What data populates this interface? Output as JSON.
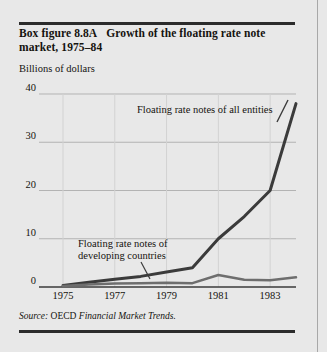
{
  "figure": {
    "label": "Box figure 8.8A",
    "title": "Growth of the floating rate note market, 1975–84",
    "source_prefix": "Source:",
    "source_org": "OECD",
    "source_publication": "Financial Market Trends."
  },
  "chart_data": {
    "type": "line",
    "title": "Growth of the floating rate note market, 1975–84",
    "xlabel": "",
    "ylabel": "Billions of dollars",
    "x": [
      1975,
      1976,
      1977,
      1978,
      1979,
      1980,
      1981,
      1982,
      1983,
      1984
    ],
    "xtick_labels": [
      "1975",
      "1977",
      "1979",
      "1981",
      "1983"
    ],
    "xticks": [
      1975,
      1977,
      1979,
      1981,
      1983
    ],
    "ytick_labels": [
      "0",
      "10",
      "20",
      "30",
      "40"
    ],
    "yticks": [
      0,
      10,
      20,
      30,
      40
    ],
    "ylim": [
      0,
      40
    ],
    "xlim": [
      1975,
      1984
    ],
    "grid": true,
    "legend": "annotations",
    "series": [
      {
        "name": "Floating rate notes of all entities",
        "values": [
          0.3,
          1.0,
          1.6,
          2.2,
          3.1,
          4.0,
          10.0,
          14.6,
          20.0,
          38.0
        ],
        "color": "#3b3b3b",
        "width": 3
      },
      {
        "name": "Floating rate notes of developing countries",
        "values": [
          0.2,
          0.5,
          0.7,
          0.8,
          0.9,
          0.8,
          2.5,
          1.5,
          1.4,
          2.0
        ],
        "color": "#6e6e6e",
        "width": 2.5
      }
    ],
    "annotations": [
      {
        "id": "annot-all-entities",
        "text": "Floating rate notes of all entities",
        "lines": [
          "Floating rate notes of all entities"
        ]
      },
      {
        "id": "annot-developing-countries",
        "text": "Floating rate notes of developing countries",
        "lines": [
          "Floating rate notes of",
          "developing countries"
        ]
      }
    ]
  }
}
